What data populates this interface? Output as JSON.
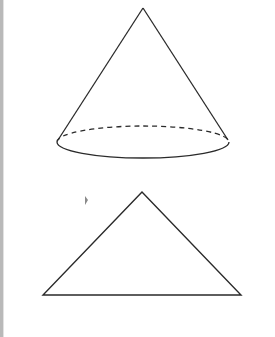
{
  "diagram": {
    "type": "geometry",
    "stroke_color": "#2a2a2a",
    "border_color": "#b9b9b9",
    "shapes": [
      {
        "name": "cone",
        "apex": [
          143,
          8
        ],
        "base_ellipse": {
          "cx": 143,
          "cy": 142,
          "rx": 86,
          "ry": 16
        },
        "back_edge": "dashed",
        "front_edge": "solid"
      },
      {
        "name": "triangle",
        "points": [
          [
            142,
            192
          ],
          [
            43,
            295
          ],
          [
            241,
            295
          ]
        ],
        "description": "cross-section of cone"
      }
    ],
    "marks": [
      {
        "name": "small-mark",
        "x": 86,
        "y": 200
      }
    ]
  }
}
